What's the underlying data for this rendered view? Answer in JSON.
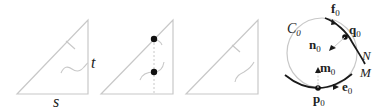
{
  "panels": [
    {
      "id": "panel-1",
      "labels": {
        "t": "t",
        "s": "s"
      }
    },
    {
      "id": "panel-2",
      "points": 2
    },
    {
      "id": "panel-3"
    },
    {
      "id": "panel-4",
      "labels": {
        "C": "C",
        "C_sub": "0",
        "f": "f",
        "f_sub": "0",
        "q": "q",
        "q_sub": "0",
        "n": "n",
        "n_sub": "0",
        "m": "m",
        "m_sub": "0",
        "N": "N",
        "M": "M",
        "p": "p",
        "p_sub": "0",
        "e": "e",
        "e_sub": "0"
      }
    }
  ],
  "colors": {
    "triangle_stroke": "#c8c8c8",
    "curve_dark": "#1a1a1a",
    "circle_stroke": "#c8c8c8",
    "dot": "#111111"
  }
}
